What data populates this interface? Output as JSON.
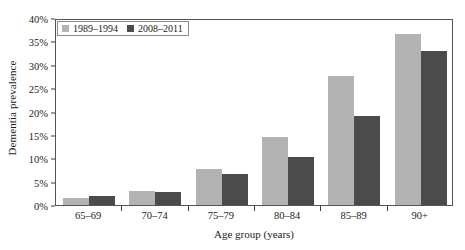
{
  "chart_data": {
    "type": "bar",
    "title": "",
    "xlabel": "Age group (years)",
    "ylabel": "Dementia prevalence",
    "categories": [
      "65–69",
      "70–74",
      "75–79",
      "80–84",
      "85–89",
      "90+"
    ],
    "series": [
      {
        "name": "1989–1994",
        "color": "#b3b3b3",
        "values": [
          1.6,
          2.9,
          7.6,
          14.5,
          27.5,
          36.5
        ]
      },
      {
        "name": "2008–2011",
        "color": "#4b4b4b",
        "values": [
          1.9,
          2.8,
          6.7,
          10.3,
          19.0,
          33.0
        ]
      }
    ],
    "ylim": [
      0,
      40
    ],
    "yticks": [
      0,
      5,
      10,
      15,
      20,
      25,
      30,
      35,
      40
    ],
    "ytick_labels": [
      "0%",
      "5%",
      "10%",
      "15%",
      "20%",
      "25%",
      "30%",
      "35%",
      "40%"
    ],
    "grid": false,
    "legend_position": "top-left",
    "legend": [
      "1989–1994",
      "2008–2011"
    ]
  }
}
